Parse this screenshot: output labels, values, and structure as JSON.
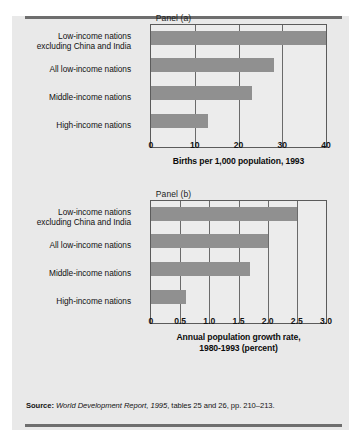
{
  "figure": {
    "panel_a_title": "Panel (a)",
    "panel_b_title": "Panel (b)",
    "source_label": "Source:",
    "source_italic_1": "World Development Report, 1995",
    "source_rest": ", tables 25 and 26, pp. 210–213.",
    "bar_color": "#909090",
    "panel_background": "#e9e9e9",
    "plot_background": "#ececec",
    "frame_color": "#5b5b5b",
    "rule_color": "#6e6e6e"
  },
  "chart_data": [
    {
      "type": "bar",
      "orientation": "horizontal",
      "title": "Panel (a)",
      "xlabel": "Births per 1,000 population, 1993",
      "ylabel": "",
      "xlim": [
        0,
        40
      ],
      "xticks": [
        0,
        10,
        20,
        30,
        40
      ],
      "xticklabels": [
        "0",
        "10",
        "20",
        "30",
        "40"
      ],
      "gridlines": [
        10,
        20,
        30
      ],
      "grid": true,
      "legend": null,
      "categories": [
        "Low-income nations excluding China and India",
        "All low-income nations",
        "Middle-income nations",
        "High-income nations"
      ],
      "category_lines": [
        [
          "Low-income nations",
          "excluding China and India"
        ],
        [
          "All low-income nations"
        ],
        [
          "Middle-income nations"
        ],
        [
          "High-income nations"
        ]
      ],
      "values": [
        40,
        28,
        23,
        13
      ]
    },
    {
      "type": "bar",
      "orientation": "horizontal",
      "title": "Panel (b)",
      "xlabel": "Annual population growth rate, 1980-1993 (percent)",
      "xlabel_lines": [
        "Annual population growth rate,",
        "1980-1993 (percent)"
      ],
      "ylabel": "",
      "xlim": [
        0,
        3.0
      ],
      "xticks": [
        0,
        0.5,
        1.0,
        1.5,
        2.0,
        2.5,
        3.0
      ],
      "xticklabels": [
        "0",
        "0.5",
        "1.0",
        "1.5",
        "2.0",
        "2.5",
        "3.0"
      ],
      "gridlines": [
        0.5,
        1.0,
        1.5,
        2.0,
        2.5
      ],
      "grid": true,
      "legend": null,
      "categories": [
        "Low-income nations excluding China and India",
        "All low-income nations",
        "Middle-income nations",
        "High-income nations"
      ],
      "category_lines": [
        [
          "Low-income nations",
          "excluding China and India"
        ],
        [
          "All low-income nations"
        ],
        [
          "Middle-income nations"
        ],
        [
          "High-income nations"
        ]
      ],
      "values": [
        2.5,
        2.0,
        1.7,
        0.6
      ]
    }
  ]
}
